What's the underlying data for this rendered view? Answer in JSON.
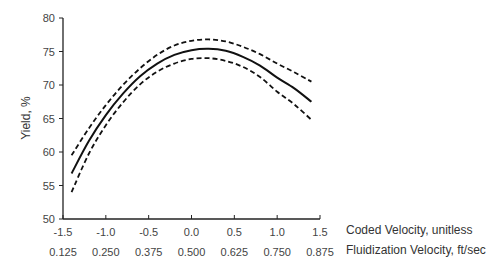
{
  "chart_data": {
    "type": "line",
    "title": "",
    "ylabel": "Yield, %",
    "xlabel": "Coded Velocity, unitless",
    "xlabel_secondary": "Fluidization Velocity, ft/sec",
    "ylim": [
      50,
      80
    ],
    "xlim": [
      -1.5,
      1.5
    ],
    "yticks": [
      "50",
      "55",
      "60",
      "65",
      "70",
      "75",
      "80"
    ],
    "xticks": [
      "-1.5",
      "-1.0",
      "-0.5",
      "0.0",
      "0.5",
      "1.0",
      "1.5"
    ],
    "xticks_secondary": [
      "0.125",
      "0.250",
      "0.375",
      "0.500",
      "0.625",
      "0.750",
      "0.875"
    ],
    "grid": false,
    "legend": "none",
    "x": [
      -1.4,
      -1.2,
      -1.0,
      -0.8,
      -0.6,
      -0.4,
      -0.2,
      0.0,
      0.2,
      0.4,
      0.6,
      0.8,
      1.0,
      1.2,
      1.4
    ],
    "series": [
      {
        "name": "Predicted",
        "style": "solid",
        "values": [
          56.8,
          61.6,
          65.5,
          68.7,
          71.3,
          73.2,
          74.5,
          75.2,
          75.4,
          75.1,
          74.2,
          72.9,
          71.1,
          69.5,
          67.5
        ]
      },
      {
        "name": "Upper bound",
        "style": "dashed",
        "values": [
          59.5,
          63.5,
          67.0,
          70.0,
          72.5,
          74.5,
          75.9,
          76.6,
          76.8,
          76.5,
          75.7,
          74.6,
          73.2,
          71.9,
          70.5
        ]
      },
      {
        "name": "Lower bound",
        "style": "dashed",
        "values": [
          54.0,
          59.7,
          64.0,
          67.4,
          70.1,
          72.0,
          73.2,
          73.9,
          74.0,
          73.6,
          72.7,
          71.2,
          69.0,
          67.1,
          64.8
        ]
      }
    ]
  }
}
